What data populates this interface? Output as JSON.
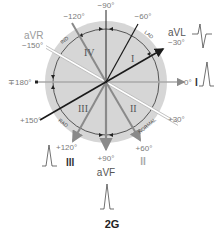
{
  "figure": {
    "label": "2G",
    "colors": {
      "disc": "#d6d6d6",
      "dark_axis": "#1a1a1a",
      "gray_axis": "#8a8a8a",
      "label": "#7a7a7a"
    }
  },
  "angles": {
    "m90": "−90°",
    "m120": "−120°",
    "m60": "−60°",
    "m150": "−150°",
    "m30": "−30°",
    "pm180": "∓180°",
    "zero": "0°",
    "p150": "+150°",
    "p30": "+30°",
    "p120": "+120°",
    "p90": "+90°",
    "p60": "+60°"
  },
  "leads": {
    "avr": "aVR",
    "avl": "aVL",
    "avf": "aVF",
    "i": "I",
    "ii": "II",
    "iii": "III"
  },
  "quadrants": {
    "q1": "I",
    "q2": "II",
    "q3": "III",
    "q4": "IV"
  },
  "arc_labels": {
    "ind": "IND",
    "lad": "LAD",
    "rad": "RAD",
    "normal": "NORMAL"
  }
}
